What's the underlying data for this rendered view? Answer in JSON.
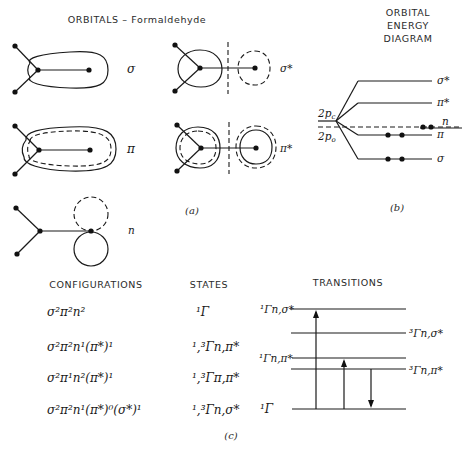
{
  "title": "ORBITALS – Formaldehyde",
  "energy_diagram": {
    "title_lines": [
      "ORBITAL",
      "ENERGY",
      "DIAGRAM"
    ],
    "atomic_levels": [
      "2p_C",
      "2p_O"
    ],
    "levels": [
      {
        "label": "σ*",
        "electrons": 0
      },
      {
        "label": "π*",
        "electrons": 0
      },
      {
        "label": "n",
        "electrons": 2
      },
      {
        "label": "π",
        "electrons": 2
      },
      {
        "label": "σ",
        "electrons": 2
      }
    ],
    "caption": "(b)"
  },
  "orbitals": {
    "items": [
      {
        "label": "σ",
        "bonding": true
      },
      {
        "label": "σ*",
        "bonding": false
      },
      {
        "label": "π",
        "bonding": true
      },
      {
        "label": "π*",
        "bonding": false
      },
      {
        "label": "n",
        "bonding": false
      }
    ],
    "caption": "(a)"
  },
  "table": {
    "headers": {
      "configurations": "CONFIGURATIONS",
      "states": "STATES",
      "transitions": "TRANSITIONS"
    },
    "rows": [
      {
        "configuration": "σ²π²n²",
        "state": "¹Γ"
      },
      {
        "configuration": "σ²π²n¹(π*)¹",
        "state": "¹,³Γn,π*"
      },
      {
        "configuration": "σ²π¹n²(π*)¹",
        "state": "¹,³Γπ,π*"
      },
      {
        "configuration": "σ²π²n¹(π*)⁰(σ*)¹",
        "state": "¹,³Γn,σ*"
      }
    ],
    "caption": "(c)"
  },
  "transitions": {
    "levels": [
      {
        "label": "¹Γn,σ*",
        "side": "left"
      },
      {
        "label": "³Γn,σ*",
        "side": "right"
      },
      {
        "label": "¹Γn,π*",
        "side": "left"
      },
      {
        "label": "³Γn,π*",
        "side": "right"
      },
      {
        "label": "¹Γ",
        "side": "left"
      }
    ],
    "arrows": [
      {
        "from": "¹Γ",
        "to": "¹Γn,σ*",
        "direction": "up"
      },
      {
        "from": "¹Γ",
        "to": "¹Γn,π*",
        "direction": "up"
      },
      {
        "from": "³Γn,π*",
        "to": "¹Γ",
        "direction": "down"
      }
    ]
  }
}
